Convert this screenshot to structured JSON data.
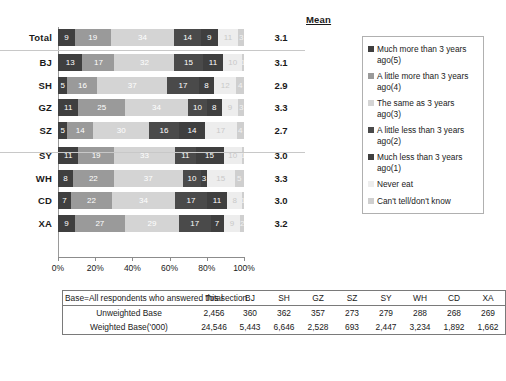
{
  "chart_data": {
    "type": "bar",
    "orientation": "horizontal",
    "stacked": true,
    "stack_mode": "percent",
    "title": "",
    "xlabel": "",
    "ylabel": "",
    "xlim": [
      0,
      100
    ],
    "grid": false,
    "legend_position": "right",
    "categories": [
      "Total",
      "BJ",
      "SH",
      "GZ",
      "SZ",
      "SY",
      "WH",
      "CD",
      "XA"
    ],
    "tick_labels": [
      "0%",
      "20%",
      "40%",
      "60%",
      "80%",
      "100%"
    ],
    "tick_values": [
      0,
      20,
      40,
      60,
      80,
      100
    ],
    "series": [
      {
        "name": "Much more than 3 years ago(5)",
        "color": "#3f3f3f",
        "values": [
          9,
          13,
          5,
          11,
          5,
          11,
          8,
          7,
          9
        ]
      },
      {
        "name": "A little more than 3 years ago(4)",
        "color": "#9a9a9a",
        "values": [
          19,
          17,
          16,
          25,
          14,
          19,
          22,
          22,
          27
        ]
      },
      {
        "name": "The same as 3 years ago(3)",
        "color": "#d4d4d4",
        "values": [
          34,
          32,
          37,
          34,
          30,
          33,
          37,
          34,
          29
        ]
      },
      {
        "name": "A little less than 3 years ago(2)",
        "color": "#4a4a4a",
        "values": [
          14,
          15,
          17,
          10,
          16,
          11,
          10,
          17,
          17
        ]
      },
      {
        "name": "Much less than 3 years ago(1)",
        "color": "#3f3f3f",
        "values": [
          9,
          11,
          8,
          8,
          14,
          15,
          3,
          11,
          7
        ]
      },
      {
        "name": "Never eat",
        "color": "#ededed",
        "values": [
          11,
          10,
          12,
          9,
          17,
          10,
          15,
          8,
          9
        ]
      },
      {
        "name": "Can't tell/don't know",
        "color": "#cfcfcf",
        "values": [
          3,
          1,
          4,
          3,
          4,
          1,
          5,
          1,
          2
        ]
      }
    ],
    "mean_header": "Mean",
    "means": [
      "3.1",
      "3.1",
      "2.9",
      "3.3",
      "2.7",
      "3.0",
      "3.3",
      "3.0",
      "3.2"
    ],
    "group_breaks": [
      1,
      5
    ]
  },
  "legend": {
    "items": [
      {
        "label": "Much more than 3 years ago(5)",
        "color": "#3f3f3f"
      },
      {
        "label": "A little more than 3 years ago(4)",
        "color": "#9a9a9a"
      },
      {
        "label": "The same as 3 years ago(3)",
        "color": "#d4d4d4"
      },
      {
        "label": "A little less than 3 years ago(2)",
        "color": "#4a4a4a"
      },
      {
        "label": "Much less than 3 years ago(1)",
        "color": "#3f3f3f"
      },
      {
        "label": "Never eat",
        "color": "#ededed"
      },
      {
        "label": "Can't tell/don't know",
        "color": "#cfcfcf"
      }
    ]
  },
  "base_table": {
    "corner_label": "Base=All respondents who answered this section",
    "columns": [
      "Total",
      "BJ",
      "SH",
      "GZ",
      "SZ",
      "SY",
      "WH",
      "CD",
      "XA"
    ],
    "rows": [
      {
        "label": "Unweighted Base",
        "values": [
          "2,456",
          "360",
          "362",
          "357",
          "273",
          "279",
          "288",
          "268",
          "269"
        ]
      },
      {
        "label": "Weighted Base('000)",
        "values": [
          "24,546",
          "5,443",
          "6,646",
          "2,528",
          "693",
          "2,447",
          "3,234",
          "1,892",
          "1,662"
        ]
      }
    ]
  }
}
